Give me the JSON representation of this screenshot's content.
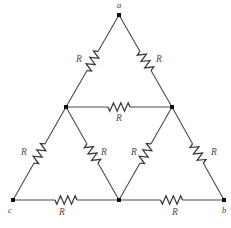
{
  "figure": {
    "background_color": "#ffffff",
    "wire_color": "#4a4a4a",
    "node_color": "#111111",
    "label_color": "#4f4f4f"
  },
  "nodes": [
    {
      "id": "a",
      "label": "a",
      "x": 119,
      "y": 15,
      "label_x": 119,
      "label_y": 6
    },
    {
      "id": "b",
      "label": "b",
      "x": 224,
      "y": 200,
      "label_x": 224,
      "label_y": 211
    },
    {
      "id": "c",
      "label": "c",
      "x": 13,
      "y": 200,
      "label_x": 10,
      "label_y": 211
    },
    {
      "id": "m_left",
      "label": "",
      "x": 66,
      "y": 107,
      "label_x": 66,
      "label_y": 107
    },
    {
      "id": "m_right",
      "label": "",
      "x": 172,
      "y": 107,
      "label_x": 172,
      "label_y": 107
    },
    {
      "id": "m_bottom",
      "label": "",
      "x": 119,
      "y": 200,
      "label_x": 119,
      "label_y": 200
    }
  ],
  "resistors": [
    {
      "id": "r_a_mleft",
      "label": "R",
      "from": "a",
      "to": "m_left",
      "label_x": 79,
      "label_y": 60
    },
    {
      "id": "r_a_mright",
      "label": "R",
      "from": "a",
      "to": "m_right",
      "label_x": 159,
      "label_y": 60
    },
    {
      "id": "r_mid_h",
      "label": "R",
      "from": "m_left",
      "to": "m_right",
      "label_x": 119,
      "label_y": 119
    },
    {
      "id": "r_c_mleft",
      "label": "R",
      "from": "c",
      "to": "m_left",
      "label_x": 24,
      "label_y": 153
    },
    {
      "id": "r_mleft_mb",
      "label": "R",
      "from": "m_left",
      "to": "m_bottom",
      "label_x": 104,
      "label_y": 153
    },
    {
      "id": "r_mright_mb",
      "label": "R",
      "from": "m_right",
      "to": "m_bottom",
      "label_x": 134,
      "label_y": 153
    },
    {
      "id": "r_b_mright",
      "label": "R",
      "from": "m_right",
      "to": "b",
      "label_x": 214,
      "label_y": 153
    },
    {
      "id": "r_c_mb",
      "label": "R",
      "from": "c",
      "to": "m_bottom",
      "label_x": 62,
      "label_y": 213
    },
    {
      "id": "r_mb_b",
      "label": "R",
      "from": "m_bottom",
      "to": "b",
      "label_x": 175,
      "label_y": 213
    }
  ],
  "geometry": {
    "width": 231,
    "height": 228,
    "zigzag_peaks": 6,
    "zigzag_amplitude": 4.2,
    "zigzag_length": 22
  }
}
